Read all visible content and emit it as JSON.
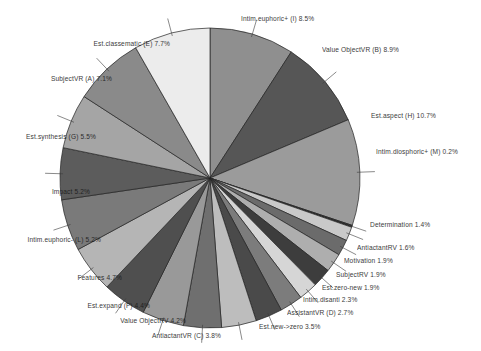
{
  "chart_data": {
    "type": "pie",
    "title": "",
    "subtitle": "",
    "xlabel": "",
    "ylabel": "",
    "legend_position": "none",
    "grid": false,
    "label_format": "name percent",
    "start_angle_deg": -90,
    "direction": "clockwise",
    "center": {
      "x": 210,
      "y": 178
    },
    "radius": 150,
    "categories": [
      "Intim.euphoric+ (I)",
      "Value ObjectVR (B)",
      "Est.aspect (H)",
      "Intim.diosphoric+ (M)",
      "Determination",
      "AntiactantRV",
      "Motivation",
      "SubjectRV",
      "Est.zero-new",
      "Intim.disanti",
      "AssistantVR (D)",
      "Est.new->zero",
      "AntiactantVR (C)",
      "Value ObjectRV",
      "Est.expand (F)",
      "Features",
      "Intim.euphoric- (L)",
      "Impact",
      "Est.synthesis (G)",
      "SubjectVR (A)",
      "Est.classematic (E)"
    ],
    "values": [
      8.5,
      8.9,
      10.7,
      0.2,
      1.4,
      1.6,
      1.9,
      1.9,
      1.9,
      2.3,
      2.7,
      3.5,
      3.8,
      4.2,
      4.4,
      4.7,
      5.2,
      5.2,
      5.5,
      7.1,
      7.7
    ],
    "units": "percent",
    "colors": [
      "#8f8f8f",
      "#565656",
      "#9b9b9b",
      "#2e2e2e",
      "#c9c9c9",
      "#6b6b6b",
      "#aeaeae",
      "#3d3d3d",
      "#d6d6d6",
      "#7c7c7c",
      "#4a4a4a",
      "#bdbdbd",
      "#6f6f6f",
      "#999999",
      "#4f4f4f",
      "#b5b5b5",
      "#7a7a7a",
      "#5c5c5c",
      "#a5a5a5",
      "#8a8a8a",
      "#ececec"
    ],
    "slices": [
      {
        "label": "Intim.euphoric+ (I)",
        "percent": "8.5%",
        "text": "Intim.euphoric+ (I)  8.5%",
        "side": "right",
        "x": 241,
        "y": 16,
        "color": "#8f8f8f"
      },
      {
        "label": "Value ObjectVR (B)",
        "percent": "8.9%",
        "text": "Value ObjectVR (B)  8.9%",
        "side": "right",
        "x": 322,
        "y": 47,
        "color": "#565656"
      },
      {
        "label": "Est.aspect (H)",
        "percent": "10.7%",
        "text": "Est.aspect (H)  10.7%",
        "side": "right",
        "x": 371,
        "y": 113,
        "color": "#9b9b9b"
      },
      {
        "label": "Intim.diosphoric+ (M)",
        "percent": "0.2%",
        "text": "Intim.diosphoric+ (M)  0.2%",
        "side": "right",
        "x": 376,
        "y": 149,
        "color": "#2e2e2e"
      },
      {
        "label": "Determination",
        "percent": "1.4%",
        "text": "Determination  1.4%",
        "side": "right",
        "x": 370,
        "y": 222,
        "color": "#c9c9c9"
      },
      {
        "label": "AntiactantRV",
        "percent": "1.6%",
        "text": "AntiactantRV  1.6%",
        "side": "right",
        "x": 357,
        "y": 245,
        "color": "#6b6b6b"
      },
      {
        "label": "Motivation",
        "percent": "1.9%",
        "text": "Motivation  1.9%",
        "side": "right",
        "x": 344,
        "y": 258,
        "color": "#aeaeae"
      },
      {
        "label": "SubjectRV",
        "percent": "1.9%",
        "text": "SubjectRV  1.9%",
        "side": "right",
        "x": 336,
        "y": 272,
        "color": "#3d3d3d"
      },
      {
        "label": "Est.zero-new",
        "percent": "1.9%",
        "text": "Est.zero-new  1.9%",
        "side": "right",
        "x": 322,
        "y": 285,
        "color": "#d6d6d6"
      },
      {
        "label": "Intim.disanti",
        "percent": "2.3%",
        "text": "Intim.disanti  2.3%",
        "side": "right",
        "x": 303,
        "y": 297,
        "color": "#7c7c7c"
      },
      {
        "label": "AssistantVR (D)",
        "percent": "2.7%",
        "text": "AssistantVR (D)  2.7%",
        "side": "right",
        "x": 287,
        "y": 310,
        "color": "#4a4a4a"
      },
      {
        "label": "Est.new->zero",
        "percent": "3.5%",
        "text": "Est.new->zero  3.5%",
        "side": "right",
        "x": 259,
        "y": 324,
        "color": "#bdbdbd"
      },
      {
        "label": "AntiactantVR (C)",
        "percent": "3.8%",
        "text": "AntiactantVR (C)  3.8%",
        "side": "left",
        "x": 221,
        "y": 333,
        "color": "#6f6f6f"
      },
      {
        "label": "Value ObjectRV",
        "percent": "4.2%",
        "text": "Value ObjectRV  4.2%",
        "side": "left",
        "x": 186,
        "y": 318,
        "color": "#999999"
      },
      {
        "label": "Est.expand (F)",
        "percent": "4.4%",
        "text": "Est.expand (F)  4.4%",
        "side": "left",
        "x": 150,
        "y": 303,
        "color": "#4f4f4f"
      },
      {
        "label": "Features",
        "percent": "4.7%",
        "text": "Features  4.7%",
        "side": "left",
        "x": 122,
        "y": 275,
        "color": "#b5b5b5"
      },
      {
        "label": "Intim.euphoric- (L)",
        "percent": "5.2%",
        "text": "Intim.euphoric- (L)  5.2%",
        "side": "left",
        "x": 101,
        "y": 237,
        "color": "#7a7a7a"
      },
      {
        "label": "Impact",
        "percent": "5.2%",
        "text": "Impact  5.2%",
        "side": "left",
        "x": 90,
        "y": 189,
        "color": "#5c5c5c"
      },
      {
        "label": "Est.synthesis (G)",
        "percent": "5.5%",
        "text": "Est.synthesis (G)  5.5%",
        "side": "left",
        "x": 96,
        "y": 134,
        "color": "#a5a5a5"
      },
      {
        "label": "SubjectVR (A)",
        "percent": "7.1%",
        "text": "SubjectVR (A)  7.1%",
        "side": "left",
        "x": 112,
        "y": 76,
        "color": "#8a8a8a"
      },
      {
        "label": "Est.classematic (E)",
        "percent": "7.7%",
        "text": "Est.classematic (E)  7.7%",
        "side": "left",
        "x": 170,
        "y": 41,
        "color": "#ececec"
      }
    ]
  }
}
